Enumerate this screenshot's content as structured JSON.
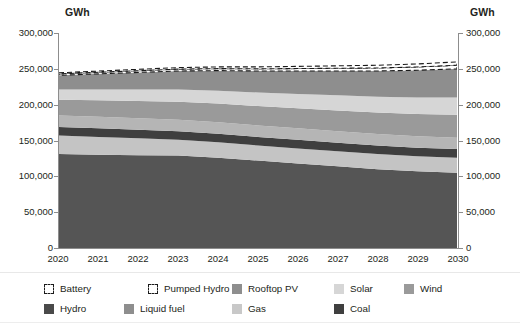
{
  "axis_unit_left": "GWh",
  "axis_unit_right": "GWh",
  "y_ticks": [
    "300,000",
    "250,000",
    "200,000",
    "150,000",
    "100,000",
    "50,000",
    "0"
  ],
  "x_ticks": [
    "2020",
    "2021",
    "2022",
    "2023",
    "2024",
    "2025",
    "2026",
    "2027",
    "2028",
    "2029",
    "2030"
  ],
  "legend": {
    "row1": [
      {
        "label": "Battery",
        "color": "#ffffff",
        "style": "dashed"
      },
      {
        "label": "Pumped Hydro",
        "color": "#ffffff",
        "style": "dashed"
      },
      {
        "label": "Rooftop PV",
        "color": "#8e8e8e",
        "style": "solid"
      },
      {
        "label": "Solar",
        "color": "#d6d6d6",
        "style": "solid"
      },
      {
        "label": "Wind",
        "color": "#9a9a9a",
        "style": "solid"
      }
    ],
    "row2": [
      {
        "label": "Hydro",
        "color": "#4a4a4a",
        "style": "solid"
      },
      {
        "label": "Liquid fuel",
        "color": "#8e8e8e",
        "style": "solid"
      },
      {
        "label": "Gas",
        "color": "#c8c8c8",
        "style": "solid"
      },
      {
        "label": "Coal",
        "color": "#3f3f3f",
        "style": "solid"
      }
    ]
  },
  "chart_data": {
    "type": "area",
    "title": "",
    "xlabel": "",
    "ylabel": "GWh",
    "ylim": [
      0,
      300000
    ],
    "grid": false,
    "legend_position": "bottom",
    "stacked": true,
    "x": [
      2020,
      2021,
      2022,
      2023,
      2024,
      2025,
      2026,
      2027,
      2028,
      2029,
      2030
    ],
    "series": [
      {
        "name": "Coal",
        "color": "#555555",
        "values": [
          131000,
          130000,
          129500,
          129000,
          126000,
          122000,
          118000,
          114000,
          110000,
          107000,
          105000
        ]
      },
      {
        "name": "Gas",
        "color": "#c4c4c4",
        "values": [
          26000,
          25000,
          23500,
          22000,
          21500,
          21000,
          21000,
          21000,
          21000,
          21000,
          21000
        ]
      },
      {
        "name": "Liquid fuel",
        "color": "#3f3f3f",
        "values": [
          12000,
          12000,
          12000,
          12000,
          12000,
          12000,
          12000,
          12000,
          12000,
          12000,
          12000
        ]
      },
      {
        "name": "Hydro",
        "color": "#b5b5b5",
        "values": [
          16000,
          16000,
          16000,
          16000,
          16000,
          16000,
          16000,
          16000,
          16000,
          16000,
          16000
        ]
      },
      {
        "name": "Wind",
        "color": "#9a9a9a",
        "values": [
          22000,
          23000,
          24000,
          25000,
          26000,
          27000,
          28000,
          29000,
          30000,
          31000,
          32000
        ]
      },
      {
        "name": "Solar",
        "color": "#d6d6d6",
        "values": [
          14000,
          15000,
          16000,
          17000,
          18000,
          19000,
          20000,
          21000,
          22000,
          23000,
          24000
        ]
      },
      {
        "name": "Rooftop PV",
        "color": "#8e8e8e",
        "values": [
          20000,
          22000,
          24000,
          26000,
          28000,
          30000,
          32000,
          34000,
          36000,
          38000,
          40000
        ]
      },
      {
        "name": "Pumped Hydro",
        "color": "#ffffff",
        "values": [
          2000,
          2200,
          2400,
          2600,
          2800,
          3000,
          3400,
          3800,
          4200,
          4600,
          5000
        ]
      },
      {
        "name": "Battery",
        "color": "#ffffff",
        "values": [
          1500,
          1700,
          1900,
          2100,
          2400,
          2700,
          3000,
          3400,
          3800,
          4200,
          4600
        ]
      }
    ],
    "totals": [
      244500,
      246900,
      249300,
      251700,
      252700,
      254700,
      254400,
      258200,
      259000,
      260800,
      263600
    ]
  }
}
